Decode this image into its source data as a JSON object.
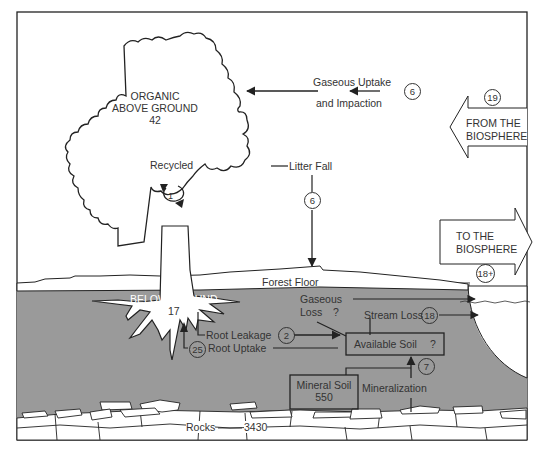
{
  "colors": {
    "soil": "#9a9a9a",
    "line": "#222222",
    "background": "#ffffff"
  },
  "compartments": {
    "organic_above_ground": {
      "line1": "ORGANIC",
      "line2": "ABOVE GROUND",
      "value": "42"
    },
    "below_ground": {
      "label": "BELOW GROUND",
      "value": "17"
    },
    "forest_floor": {
      "label": "Forest Floor"
    },
    "available_soil": {
      "label": "Available Soil",
      "value": "?"
    },
    "mineral_soil": {
      "label": "Mineral Soil",
      "value": "550"
    },
    "rocks": {
      "label": "Rocks",
      "value": "3430"
    }
  },
  "flows": {
    "recycled": {
      "label": "Recycled",
      "value": "1"
    },
    "gaseous_uptake": {
      "line1": "Gaseous Uptake",
      "line2": "and Impaction",
      "value": "6"
    },
    "from_biosphere": {
      "line1": "FROM THE",
      "line2": "BIOSPHERE",
      "value": "19"
    },
    "to_biosphere": {
      "line1": "TO THE",
      "line2": "BIOSPHERE",
      "value": "18+"
    },
    "litter_fall": {
      "label": "Litter Fall",
      "value": "6"
    },
    "gaseous_loss": {
      "line1": "Gaseous",
      "line2": "Loss",
      "value": "?"
    },
    "stream_loss": {
      "label": "Stream Loss",
      "value": "18"
    },
    "root_leakage": {
      "label": "Root Leakage",
      "value": "2"
    },
    "root_uptake": {
      "label": "Root Uptake",
      "value": "25"
    },
    "mineralization": {
      "label": "Mineralization",
      "value": "7"
    }
  }
}
